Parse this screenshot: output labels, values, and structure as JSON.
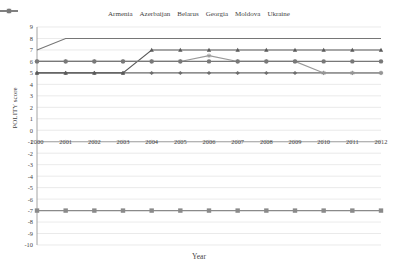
{
  "chart_data": {
    "type": "line",
    "title": "",
    "xlabel": "Year",
    "ylabel": "POLITY score",
    "x": [
      2000,
      2001,
      2002,
      2003,
      2004,
      2005,
      2006,
      2007,
      2008,
      2009,
      2010,
      2011,
      2012
    ],
    "xtick_labels": [
      "2000",
      "2001",
      "2002",
      "2003",
      "2004",
      "2005",
      "2006",
      "2007",
      "2008",
      "2009",
      "2010",
      "2011",
      "2012"
    ],
    "ytick_labels": [
      "9",
      "8",
      "7",
      "6",
      "5",
      "4",
      "3",
      "2",
      "1",
      "0",
      "-1",
      "-2",
      "-3",
      "-4",
      "-5",
      "-6",
      "-7",
      "-8",
      "-9",
      "-10"
    ],
    "ylim": [
      -10,
      9
    ],
    "xlim": [
      2000,
      2012
    ],
    "grid": true,
    "legend_position": "top",
    "series": [
      {
        "name": "Armenia",
        "color": "#6e6e6e",
        "marker": "diamond",
        "values": [
          5,
          5,
          5,
          5,
          5,
          5,
          5,
          5,
          5,
          5,
          5,
          5,
          5
        ]
      },
      {
        "name": "Azerbaijan",
        "color": "#8a8a8a",
        "marker": "square",
        "values": [
          -7,
          -7,
          -7,
          -7,
          -7,
          -7,
          -7,
          -7,
          -7,
          -7,
          -7,
          -7,
          -7
        ]
      },
      {
        "name": "Belarus",
        "color": "#5a5a5a",
        "marker": "triangle",
        "values": [
          5,
          5,
          5,
          5,
          7,
          7,
          7,
          7,
          7,
          7,
          7,
          7,
          7
        ]
      },
      {
        "name": "Georgia",
        "color": "#767676",
        "marker": "none",
        "values": [
          7,
          8,
          8,
          8,
          8,
          8,
          8,
          8,
          8,
          8,
          8,
          8,
          8
        ]
      },
      {
        "name": "Moldova",
        "color": "#999999",
        "marker": "star",
        "values": [
          6,
          6,
          6,
          6,
          6,
          6,
          6.5,
          6,
          6,
          6,
          5,
          5,
          5
        ]
      },
      {
        "name": "Ukraine",
        "color": "#787878",
        "marker": "circle",
        "values": [
          6,
          6,
          6,
          6,
          6,
          6,
          6,
          6,
          6,
          6,
          6,
          6,
          6
        ]
      }
    ]
  }
}
